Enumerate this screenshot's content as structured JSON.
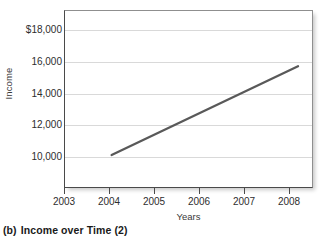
{
  "figure": {
    "caption_letter": "(b)",
    "caption_text": "Income over Time (2)"
  },
  "chart_data": {
    "type": "line",
    "title": "",
    "subtitle": "",
    "xlabel": "Years",
    "ylabel": "Income",
    "x": [
      2004,
      2008
    ],
    "values": [
      10450,
      15600
    ],
    "series": [
      {
        "name": "Income",
        "x": [
          2004,
          2008
        ],
        "values": [
          10450,
          15600
        ]
      }
    ],
    "xlim": [
      2003,
      2008.3
    ],
    "ylim": [
      8600,
      18800
    ],
    "x_tick_labels": [
      "2003",
      "2004",
      "2005",
      "2006",
      "2007",
      "2008"
    ],
    "x_ticks": [
      2003,
      2004,
      2005,
      2006,
      2007,
      2008
    ],
    "y_tick_labels": [
      "$18,000",
      "16,000",
      "14,000",
      "12,000",
      "10,000"
    ],
    "y_ticks": [
      18000,
      16000,
      14000,
      12000,
      10000
    ],
    "grid": "horizontal",
    "legend": "none",
    "line_color": "#595959",
    "grid_color": "#d9d9d9",
    "axis_color": "#4a4a4a",
    "background": "#ffffff"
  }
}
